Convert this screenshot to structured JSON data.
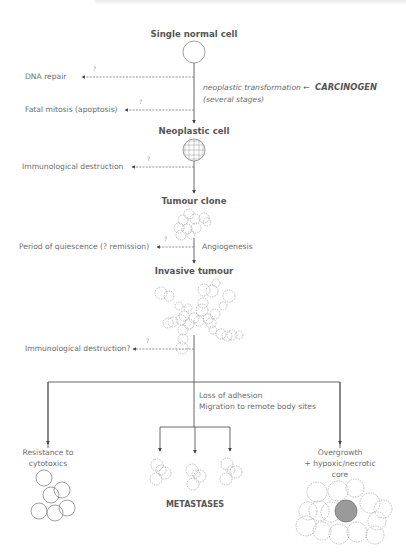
{
  "diagram": {
    "stages": [
      {
        "label": "Single normal cell"
      },
      {
        "label": "Neoplastic cell"
      },
      {
        "label": "Tumour clone"
      },
      {
        "label": "Invasive tumour"
      }
    ],
    "side_outcomes": [
      {
        "label": "DNA repair",
        "marker": "?"
      },
      {
        "label": "Fatal mitosis (apoptosis)",
        "marker": "?"
      },
      {
        "label": "Immunological destruction",
        "marker": "?"
      },
      {
        "label": "Period of quiescence (? remission)",
        "marker": "?"
      },
      {
        "label": "Immunological destruction?",
        "marker": "?"
      }
    ],
    "annotations": {
      "transformation": "neoplastic transformation ←",
      "carcinogen": "CARCINOGEN",
      "stages_note": "(several stages)",
      "angiogenesis": "Angiogenesis",
      "loss_of_adhesion": "Loss of adhesion",
      "migration": "Migration to remote body sites"
    },
    "branches": {
      "left": {
        "line1": "Resistance to",
        "line2": "cytotoxics"
      },
      "center": {
        "label": "METASTASES"
      },
      "right": {
        "line1": "Overgrowth",
        "line2": "+ hypoxic/necrotic",
        "line3": "core"
      }
    },
    "colors": {
      "line": "#444444",
      "dashed": "#777777",
      "cell_outline": "#8a8a8a",
      "necrotic_core": "#9a9a9a",
      "text": "#6e6e6e"
    }
  }
}
